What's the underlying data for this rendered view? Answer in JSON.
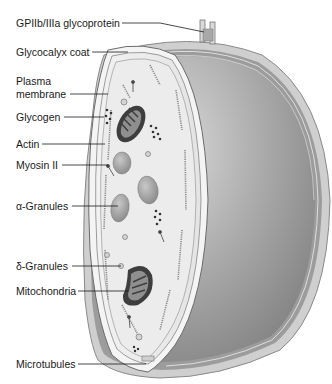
{
  "diagram": {
    "labels": [
      {
        "id": "gpiib",
        "text": "GPIIb/IIIa glycoprotein",
        "x": 16,
        "y": 17
      },
      {
        "id": "glycocalyx",
        "text": "Glycocalyx coat",
        "x": 16,
        "y": 46
      },
      {
        "id": "plasma1",
        "text": "Plasma",
        "x": 16,
        "y": 75
      },
      {
        "id": "plasma2",
        "text": "membrane",
        "x": 16,
        "y": 88
      },
      {
        "id": "glycogen",
        "text": "Glycogen",
        "x": 16,
        "y": 111
      },
      {
        "id": "actin",
        "text": "Actin",
        "x": 16,
        "y": 138
      },
      {
        "id": "myosin",
        "text": "Myosin II",
        "x": 16,
        "y": 159
      },
      {
        "id": "alpha",
        "text": "α-Granules",
        "x": 16,
        "y": 200
      },
      {
        "id": "delta",
        "text": "δ-Granules",
        "x": 16,
        "y": 260
      },
      {
        "id": "mito",
        "text": "Mitochondria",
        "x": 16,
        "y": 285
      },
      {
        "id": "micro",
        "text": "Microtubules",
        "x": 16,
        "y": 358
      }
    ]
  }
}
